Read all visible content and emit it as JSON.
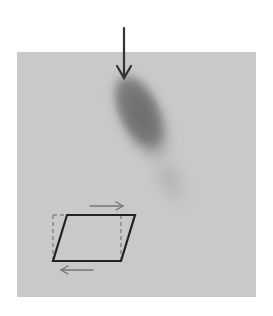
{
  "figure": {
    "panel_color": "#c9c9c9",
    "blob_color": "#6e6e6e",
    "arrow_color": "#333333",
    "shear_diagram": {
      "solid_color": "#222222",
      "dashed_color": "#555555",
      "arrow_color": "#666666",
      "top_arrow_direction": "right",
      "bottom_arrow_direction": "left"
    },
    "indicator_arrow": {
      "direction": "down"
    }
  }
}
